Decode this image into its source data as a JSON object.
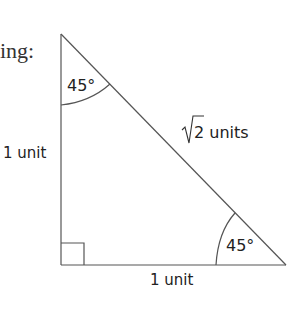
{
  "fragment_text": "ing:",
  "triangle": {
    "top_angle": "45°",
    "bottom_right_angle": "45°",
    "left_side": "1 unit",
    "bottom_side": "1 unit",
    "hypotenuse_value": "2 units",
    "hypotenuse_radical": "√",
    "right_angle_marker": true
  },
  "colors": {
    "line": "#555555",
    "text": "#222222"
  }
}
